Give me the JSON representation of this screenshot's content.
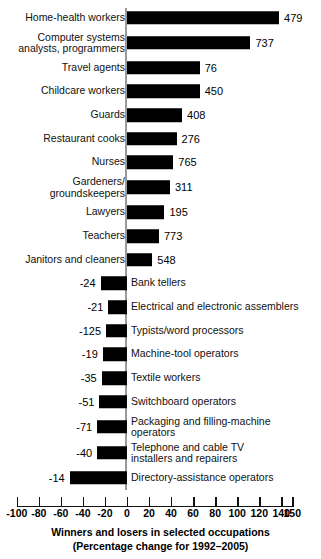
{
  "chart_data": {
    "type": "bar",
    "orientation": "horizontal",
    "title": "Winners and losers in selected occupations",
    "subtitle": "(Percentage change for 1992–2005)",
    "xlabel": "",
    "ylabel": "",
    "xlim": [
      -100,
      150
    ],
    "grid": false,
    "legend": null,
    "xticks": [
      -100,
      -80,
      -60,
      -40,
      -20,
      0,
      20,
      40,
      60,
      80,
      100,
      120,
      140,
      150
    ],
    "xticklabels": [
      "-100",
      "-80",
      "-60",
      "-40",
      "-20",
      "0",
      "20",
      "40",
      "60",
      "80",
      "100",
      "120",
      "140",
      "150"
    ],
    "categories": [
      "Home-health workers",
      "Computer systems\nanalysts, programmers",
      "Travel agents",
      "Childcare workers",
      "Guards",
      "Restaurant cooks",
      "Nurses",
      "Gardeners/\ngroundskeepers",
      "Lawyers",
      "Teachers",
      "Janitors and cleaners",
      "Bank tellers",
      "Electrical and electronic assemblers",
      "Typists/word processors",
      "Machine-tool operators",
      "Textile workers",
      "Switchboard operators",
      "Packaging and filling-machine\noperators",
      "Telephone and cable TV\ninstallers and repairers",
      "Directory-assistance operators"
    ],
    "values": [
      138,
      112,
      66,
      66,
      50,
      45,
      42,
      39,
      34,
      29,
      23,
      -24,
      -17,
      -19,
      -22,
      -23,
      -25,
      -27,
      -27,
      -52
    ],
    "data_labels": [
      "479",
      "737",
      "76",
      "450",
      "408",
      "276",
      "765",
      "311",
      "195",
      "773",
      "548",
      "-24",
      "-21",
      "-125",
      "-19",
      "-35",
      "-51",
      "-71",
      "-40",
      "-14"
    ],
    "bars": [
      {
        "category": "Home-health workers",
        "label_side": "left",
        "percent_change": 138,
        "data_label": "479",
        "label_position": "right"
      },
      {
        "category": "Computer systems\nanalysts, programmers",
        "label_side": "left",
        "percent_change": 112,
        "data_label": "737",
        "label_position": "right"
      },
      {
        "category": "Travel agents",
        "label_side": "left",
        "percent_change": 66,
        "data_label": "76",
        "label_position": "right"
      },
      {
        "category": "Childcare workers",
        "label_side": "left",
        "percent_change": 66,
        "data_label": "450",
        "label_position": "right"
      },
      {
        "category": "Guards",
        "label_side": "left",
        "percent_change": 50,
        "data_label": "408",
        "label_position": "right"
      },
      {
        "category": "Restaurant cooks",
        "label_side": "left",
        "percent_change": 45,
        "data_label": "276",
        "label_position": "right"
      },
      {
        "category": "Nurses",
        "label_side": "left",
        "percent_change": 42,
        "data_label": "765",
        "label_position": "right"
      },
      {
        "category": "Gardeners/\ngroundskeepers",
        "label_side": "left",
        "percent_change": 39,
        "data_label": "311",
        "label_position": "right"
      },
      {
        "category": "Lawyers",
        "label_side": "left",
        "percent_change": 34,
        "data_label": "195",
        "label_position": "right"
      },
      {
        "category": "Teachers",
        "label_side": "left",
        "percent_change": 29,
        "data_label": "773",
        "label_position": "right"
      },
      {
        "category": "Janitors and cleaners",
        "label_side": "left",
        "percent_change": 23,
        "data_label": "548",
        "label_position": "right"
      },
      {
        "category": "Bank tellers",
        "label_side": "right",
        "percent_change": -24,
        "data_label": "-24",
        "label_position": "left"
      },
      {
        "category": "Electrical and electronic assemblers",
        "label_side": "right",
        "percent_change": -17,
        "data_label": "-21",
        "label_position": "left"
      },
      {
        "category": "Typists/word processors",
        "label_side": "right",
        "percent_change": -19,
        "data_label": "-125",
        "label_position": "left"
      },
      {
        "category": "Machine-tool operators",
        "label_side": "right",
        "percent_change": -22,
        "data_label": "-19",
        "label_position": "left"
      },
      {
        "category": "Textile workers",
        "label_side": "right",
        "percent_change": -23,
        "data_label": "-35",
        "label_position": "left"
      },
      {
        "category": "Switchboard operators",
        "label_side": "right",
        "percent_change": -25,
        "data_label": "-51",
        "label_position": "left"
      },
      {
        "category": "Packaging and filling-machine\noperators",
        "label_side": "right",
        "percent_change": -27,
        "data_label": "-71",
        "label_position": "left"
      },
      {
        "category": "Telephone and cable TV\ninstallers and repairers",
        "label_side": "right",
        "percent_change": -27,
        "data_label": "-40",
        "label_position": "left"
      },
      {
        "category": "Directory-assistance operators",
        "label_side": "right",
        "percent_change": -52,
        "data_label": "-14",
        "label_position": "left"
      }
    ],
    "bar_color": "#000000",
    "axis_color": "#9a9a9a",
    "background": "#ffffff"
  }
}
